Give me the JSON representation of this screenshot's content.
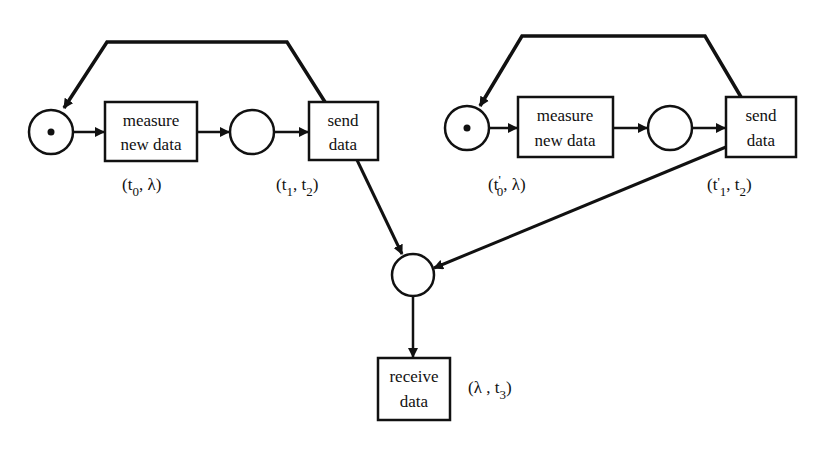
{
  "diagram": {
    "type": "petri-net",
    "colors": {
      "stroke": "#111111",
      "background": "#ffffff"
    },
    "left_net": {
      "start_place": {
        "token": true
      },
      "measure": {
        "line1": "measure",
        "line2": "new data",
        "annotation": {
          "open": "(t",
          "sub1": "0",
          "mid": ", λ)",
          "sub2": ""
        }
      },
      "middle_place": {
        "token": false
      },
      "send": {
        "line1": "send",
        "line2": "data",
        "annotation": {
          "open": "(t",
          "sub1": "1",
          "mid": ", t",
          "sub2": "2",
          "close": ")"
        }
      }
    },
    "right_net": {
      "start_place": {
        "token": true
      },
      "measure": {
        "line1": "measure",
        "line2": "new data",
        "annotation": {
          "open": "(t",
          "prime": "'",
          "sub1": "0",
          "mid": ", λ)"
        }
      },
      "middle_place": {
        "token": false
      },
      "send": {
        "line1": "send",
        "line2": "data",
        "annotation": {
          "open": "(t",
          "prime": "'",
          "sub1": "1",
          "mid": ", t",
          "sub2": "2",
          "close": ")"
        }
      }
    },
    "merge_place": {
      "token": false
    },
    "receive": {
      "line1": "receive",
      "line2": "data",
      "annotation": {
        "open": "(λ , t",
        "sub1": "3",
        "close": ")"
      }
    }
  }
}
